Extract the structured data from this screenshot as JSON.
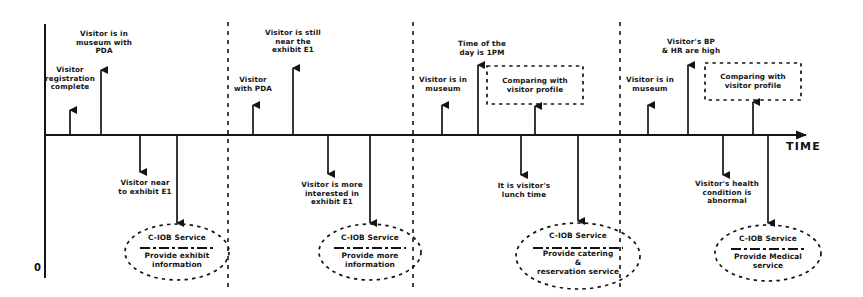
{
  "figure": {
    "kind": "timeline-scenario-diagram",
    "axis": {
      "time_label": "TIME",
      "origin_label": "0"
    },
    "colors": {
      "ink": "#141414",
      "background": "#ffffff"
    },
    "sections": [
      {
        "id": "section-1",
        "events_above": [
          {
            "text": "Visitor\nregistration\ncomplete",
            "x": 70,
            "arrow_x": 70,
            "arrow_top": 108,
            "label_y": 70
          },
          {
            "text": "Visitor is in\nmuseum with\nPDA",
            "x": 101,
            "arrow_x": 101,
            "arrow_top": 68,
            "label_y": 33
          }
        ],
        "events_below": [
          {
            "text": "Visitor near\nto exhibit E1",
            "x": 140,
            "arrow_x": 140,
            "arrow_bottom": 174,
            "label_y": 180
          }
        ],
        "service": {
          "title": "C-IOB Service",
          "body": "Provide exhibit\ninformation",
          "cx": 177,
          "cy": 252,
          "rx": 52,
          "ry": 28,
          "feed_arrow_x": 177,
          "feed_arrow_bottom": 226
        }
      },
      {
        "id": "section-2",
        "events_above": [
          {
            "text": "Visitor\nwith PDA",
            "x": 253,
            "arrow_x": 253,
            "arrow_top": 103,
            "label_y": 77
          },
          {
            "text": "Visitor is still\nnear the\nexhibit E1",
            "x": 293,
            "arrow_x": 293,
            "arrow_top": 66,
            "label_y": 31
          }
        ],
        "events_below": [
          {
            "text": "Visitor is more\ninterested in\nexhibit E1",
            "x": 328,
            "arrow_x": 328,
            "arrow_bottom": 176,
            "label_y": 182
          }
        ],
        "service": {
          "title": "C-IOB Service",
          "body": "Provide more\ninformation",
          "cx": 370,
          "cy": 252,
          "rx": 51,
          "ry": 28,
          "feed_arrow_x": 370,
          "feed_arrow_bottom": 226
        }
      },
      {
        "id": "section-3",
        "events_above": [
          {
            "text": "Visitor is in\nmuseum",
            "x": 442,
            "arrow_x": 442,
            "arrow_top": 103,
            "label_y": 78
          },
          {
            "text": "Time of the\nday is 1PM",
            "x": 478,
            "arrow_x": 478,
            "arrow_top": 63,
            "label_y": 41
          }
        ],
        "events_below": [
          {
            "text": "It is visitor's\nlunch time",
            "x": 521,
            "arrow_x": 521,
            "arrow_bottom": 177,
            "label_y": 183
          }
        ],
        "box": {
          "text": "Comparing with\nvisitor profile",
          "cx": 535,
          "cy": 85,
          "w": 96,
          "h": 38,
          "feed_arrow_x": 535,
          "feed_arrow_top": 104
        },
        "service": {
          "title": "C-IOB Service",
          "body": "Provide catering\n&\nreservation service",
          "cx": 578,
          "cy": 256,
          "rx": 62,
          "ry": 33,
          "feed_arrow_x": 578,
          "feed_arrow_bottom": 224
        }
      },
      {
        "id": "section-4",
        "events_above": [
          {
            "text": "Visitor is in\nmuseum",
            "x": 648,
            "arrow_x": 648,
            "arrow_top": 103,
            "label_y": 78
          },
          {
            "text": "Visitor's BP\n& HR are high",
            "x": 688,
            "arrow_x": 688,
            "arrow_top": 63,
            "label_y": 38
          }
        ],
        "events_below": [
          {
            "text": "Visitor's health\ncondition is\nabnormal",
            "x": 723,
            "arrow_x": 723,
            "arrow_bottom": 177,
            "label_y": 181
          }
        ],
        "box": {
          "text": "Comparing with\nvisitor profile",
          "cx": 753,
          "cy": 81,
          "w": 96,
          "h": 36,
          "feed_arrow_x": 753,
          "feed_arrow_top": 100
        },
        "service": {
          "title": "C-IOB Service",
          "body": "Provide Medical\nservice",
          "cx": 768,
          "cy": 253,
          "rx": 53,
          "ry": 28,
          "feed_arrow_x": 768,
          "feed_arrow_bottom": 226
        }
      }
    ],
    "separators_x": [
      228,
      413,
      620
    ],
    "axis_geometry": {
      "y_axis_x": 45,
      "y_axis_top": 24,
      "y_axis_bottom": 278,
      "time_axis_y": 135,
      "time_axis_x1": 45,
      "time_axis_x2": 812,
      "time_label_x": 795,
      "time_label_y": 142,
      "origin_x": 38,
      "origin_y": 268
    }
  }
}
